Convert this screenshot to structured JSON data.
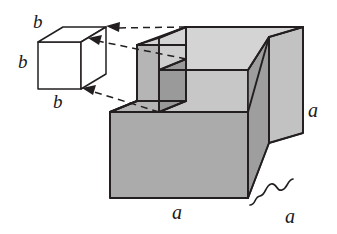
{
  "figure": {
    "type": "geometric-solid-diagram",
    "main_solid": {
      "name": "large-cube",
      "edge_label": "a",
      "labels": {
        "height_right": "a",
        "width_bottom": "a",
        "depth_brace": "a"
      },
      "notch": {
        "name": "corner-notch",
        "edge_label": "b",
        "position": "top-front-left-corner"
      }
    },
    "inset_solid": {
      "name": "removed-cube",
      "labels": {
        "top": "b",
        "left": "b",
        "bottom": "b"
      }
    },
    "connectors": {
      "name": "dashed-arrows",
      "count": 3,
      "style": "dashed",
      "direction": "from-notch-to-inset-cube"
    },
    "colors": {
      "background": "#ffffff",
      "outline": "#231f20",
      "face_top": "#d4d4d4",
      "face_front": "#ababab",
      "face_right": "#c2c2c2",
      "notch_floor": "#c9c9c9",
      "notch_side": "#9a9a9a",
      "inset_fill": "#ffffff",
      "label": "#1a1a1a"
    }
  }
}
